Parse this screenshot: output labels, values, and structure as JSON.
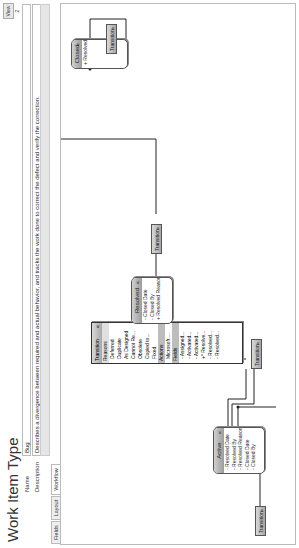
{
  "header": {
    "title": "Work Item Type",
    "view_button": "View 2",
    "name_label": "Name",
    "name_value": "Bug",
    "description_label": "Description",
    "description_value": "Describes a divergence between required and actual behavior, and tracks the work done to correct the defect and verify the correction."
  },
  "tabs": [
    {
      "label": "Fields"
    },
    {
      "label": "Layout"
    },
    {
      "label": "Workflow",
      "active": true
    }
  ],
  "workflow": {
    "states": [
      {
        "name": "Active",
        "fields": [
          "- Resolved Date",
          "- Resolved By",
          "- Resolved Reason",
          "- Closed Date",
          "- Closed By"
        ]
      },
      {
        "name": "Resolved",
        "fields": [
          "- Closed Date",
          "- Closed By",
          "+ Resolved Reason"
        ]
      },
      {
        "name": "Closed",
        "fields": [
          "+ Resolved Reason"
        ]
      }
    ],
    "transitions": {
      "label": "Transition",
      "expanded": {
        "label": "Transition",
        "reasons_header": "Reasons",
        "reasons": [
          "Deferred",
          "Duplicate",
          "As Designed",
          "Cannot Re...",
          "Obsolete",
          "Copied to...",
          "Fixed"
        ],
        "actions_header": "Actions",
        "actions": [
          "Microsoft...."
        ],
        "fields_header": "Fields",
        "fields": [
          "- Assigned...",
          "- Activated...",
          "- Activated...",
          "+* Resolve...",
          "- Resolved...",
          "- Resolved..."
        ]
      }
    },
    "colors": {
      "state_header": "#a8a8a8",
      "line": "#222222",
      "section_header": "#bdbdbd"
    }
  }
}
